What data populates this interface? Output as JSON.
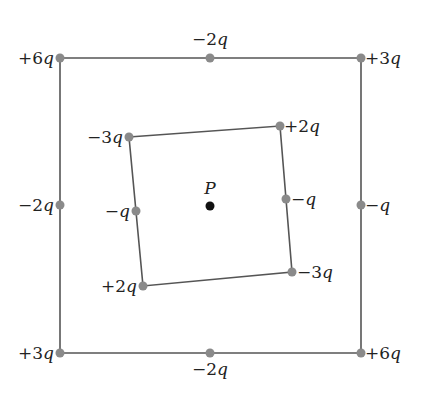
{
  "diagram": {
    "type": "charge-configuration",
    "point": {
      "label": "P",
      "x": 210,
      "y": 206,
      "label_x": 210,
      "label_y": 194
    },
    "outer_square": {
      "corners": [
        [
          60,
          58
        ],
        [
          361,
          58
        ],
        [
          361,
          353
        ],
        [
          60,
          353
        ]
      ],
      "charges": [
        {
          "id": "outer-top-left",
          "value": "+6",
          "x": 60,
          "y": 58,
          "lx": 54,
          "ly": 64,
          "anchor": "end"
        },
        {
          "id": "outer-top-mid",
          "value": "−2",
          "x": 210,
          "y": 58,
          "lx": 210,
          "ly": 45,
          "anchor": "middle"
        },
        {
          "id": "outer-top-right",
          "value": "+3",
          "x": 361,
          "y": 58,
          "lx": 365,
          "ly": 64,
          "anchor": "start"
        },
        {
          "id": "outer-left-mid",
          "value": "−2",
          "x": 60,
          "y": 205,
          "lx": 54,
          "ly": 211,
          "anchor": "end"
        },
        {
          "id": "outer-right-mid",
          "value": "−",
          "x": 361,
          "y": 205,
          "lx": 365,
          "ly": 211,
          "anchor": "start"
        },
        {
          "id": "outer-bottom-left",
          "value": "+3",
          "x": 60,
          "y": 353,
          "lx": 54,
          "ly": 359,
          "anchor": "end"
        },
        {
          "id": "outer-bottom-mid",
          "value": "−2",
          "x": 210,
          "y": 353,
          "lx": 210,
          "ly": 375,
          "anchor": "middle"
        },
        {
          "id": "outer-bottom-right",
          "value": "+6",
          "x": 361,
          "y": 353,
          "lx": 365,
          "ly": 359,
          "anchor": "start"
        }
      ]
    },
    "inner_square": {
      "corners": [
        [
          129,
          137
        ],
        [
          280,
          126
        ],
        [
          292,
          272
        ],
        [
          143,
          286
        ]
      ],
      "charges": [
        {
          "id": "inner-top-left",
          "value": "−3",
          "x": 129,
          "y": 137,
          "lx": 123,
          "ly": 143,
          "anchor": "end"
        },
        {
          "id": "inner-top-right",
          "value": "+2",
          "x": 280,
          "y": 126,
          "lx": 284,
          "ly": 132,
          "anchor": "start"
        },
        {
          "id": "inner-left-mid",
          "value": "−",
          "x": 136,
          "y": 211,
          "lx": 130,
          "ly": 217,
          "anchor": "end"
        },
        {
          "id": "inner-right-mid",
          "value": "−",
          "x": 286,
          "y": 199,
          "lx": 291,
          "ly": 205,
          "anchor": "start"
        },
        {
          "id": "inner-bottom-right",
          "value": "−3",
          "x": 292,
          "y": 272,
          "lx": 297,
          "ly": 278,
          "anchor": "start"
        },
        {
          "id": "inner-bottom-left",
          "value": "+2",
          "x": 143,
          "y": 286,
          "lx": 137,
          "ly": 292,
          "anchor": "end"
        }
      ]
    },
    "charge_unit": "q",
    "colors": {
      "charge_dot": "#8a8a8a",
      "point_dot": "#111111",
      "edge": "#555555",
      "text": "#222222"
    }
  }
}
